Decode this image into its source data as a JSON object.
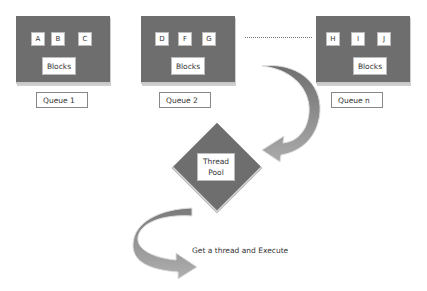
{
  "queues": [
    {
      "label": "Queue 1",
      "blocks": [
        "A",
        "B",
        "C"
      ],
      "blocks_label": "Blocks"
    },
    {
      "label": "Queue 2",
      "blocks": [
        "D",
        "F",
        "G"
      ],
      "blocks_label": "Blocks"
    },
    {
      "label": "Queue n",
      "blocks": [
        "H",
        "I",
        "J"
      ],
      "blocks_label": "Blocks"
    }
  ],
  "thread_pool": {
    "line1": "Thread",
    "line2": "Pool"
  },
  "caption": "Get a thread and Execute",
  "colors": {
    "queue_fill": "#6e6e6e",
    "arrow_dark": "#7a7a7a",
    "arrow_light": "#a8a8a8"
  }
}
